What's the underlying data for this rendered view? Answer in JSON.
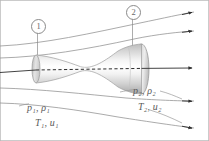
{
  "figure": {
    "type": "converging-diverging-nozzle-flow-diagram",
    "background_color": "#ffffff",
    "border_color": "#b0b0b0",
    "stations": [
      {
        "id": "station-1",
        "label": "1",
        "leader_x": 37.5,
        "leader_y_top": 32,
        "leader_y_bottom": 76
      },
      {
        "id": "station-2",
        "label": "2",
        "leader_x": 132.5,
        "leader_y_top": 18,
        "leader_y_bottom": 52
      }
    ],
    "labels": {
      "inlet_pressure_density": "p₁, ρ₁",
      "inlet_temperature_velocity": "T₁, u₁",
      "outlet_pressure_density": "p₂, ρ₂",
      "outlet_temperature_velocity": "T₂, u₂"
    },
    "label_text_color": "#5a5a5a",
    "streamline_color": "#8c8c8c",
    "axis_color": "#333333",
    "nozzle": {
      "surface_light": "#ffffff",
      "surface_mid": "#dcdcdc",
      "surface_dark": "#9a9a9a",
      "outline_color": "#9e9e9e",
      "inlet_x": 36,
      "throat_x": 92,
      "exit_x": 143
    },
    "streamlines": [
      {
        "name": "upper-outer",
        "start": [
          0,
          46
        ],
        "end": [
          196,
          12
        ],
        "arrow": true
      },
      {
        "name": "upper-inner",
        "start": [
          0,
          58
        ],
        "end": [
          196,
          31
        ],
        "arrow": true
      },
      {
        "name": "center-axis",
        "start": [
          0,
          72
        ],
        "end": [
          196,
          68
        ],
        "arrow": true,
        "dashed_inside_nozzle": true
      },
      {
        "name": "lower-inner",
        "start": [
          0,
          88
        ],
        "end": [
          196,
          101
        ],
        "arrow": true
      },
      {
        "name": "lower-outer",
        "start": [
          0,
          103
        ],
        "end": [
          196,
          128
        ],
        "arrow": true
      }
    ]
  }
}
